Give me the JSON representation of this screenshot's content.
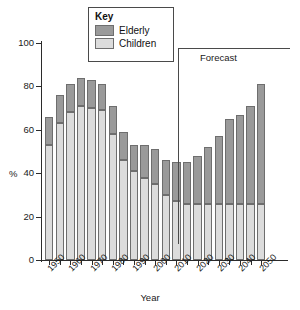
{
  "chart_data": {
    "type": "bar",
    "stacked": true,
    "title": "",
    "xlabel": "Year",
    "ylabel": "%",
    "ylim": [
      0,
      100
    ],
    "ytick_values": [
      0,
      20,
      40,
      60,
      80,
      100
    ],
    "ytick_labels": [
      "0",
      "20",
      "40",
      "60",
      "80",
      "100"
    ],
    "grid": false,
    "legend": {
      "title": "Key",
      "position": "top-center",
      "entries": [
        {
          "name": "Elderly",
          "color": "#9a9a9a"
        },
        {
          "name": "Children",
          "color": "#dcdcdc"
        }
      ]
    },
    "annotations": [
      {
        "text": "Forecast",
        "type": "bracket",
        "covers_from": 2010,
        "covers_to": 2050
      }
    ],
    "x": [
      1950,
      1955,
      1960,
      1965,
      1970,
      1975,
      1980,
      1985,
      1990,
      1995,
      2000,
      2005,
      2010,
      2015,
      2020,
      2025,
      2030,
      2035,
      2040,
      2045,
      2050
    ],
    "xtick_labels": [
      "1950",
      "1960",
      "1970",
      "1980",
      "1990",
      "2000",
      "2010",
      "2020",
      "2030",
      "2040",
      "2050"
    ],
    "xtick_years": [
      1950,
      1960,
      1970,
      1980,
      1990,
      2000,
      2010,
      2020,
      2030,
      2040,
      2050
    ],
    "series": [
      {
        "name": "Children",
        "color": "#dcdcdc",
        "values": [
          53,
          63,
          68,
          71,
          70,
          69,
          58,
          46,
          41,
          38,
          35,
          30,
          27,
          26,
          26,
          26,
          26,
          26,
          26,
          26,
          26
        ]
      },
      {
        "name": "Elderly",
        "color": "#9a9a9a",
        "values": [
          13,
          13,
          13,
          13,
          13,
          12,
          13,
          13,
          12,
          15,
          16,
          16,
          18,
          19,
          22,
          26,
          31,
          39,
          41,
          45,
          55
        ]
      }
    ],
    "totals": [
      66,
      76,
      81,
      84,
      83,
      81,
      71,
      59,
      53,
      53,
      51,
      46,
      45,
      45,
      48,
      52,
      57,
      65,
      67,
      71,
      81
    ]
  }
}
